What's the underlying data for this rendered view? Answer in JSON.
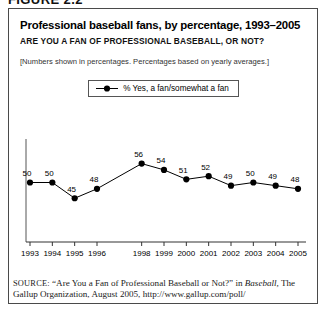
{
  "figure": {
    "label": "FIGURE 2.2"
  },
  "header": {
    "title": "Professional baseball fans, by percentage, 1993–2005",
    "subtitle": "ARE YOU A FAN OF PROFESSIONAL BASEBALL, OR NOT?",
    "note": "[Numbers shown in percentages. Percentages based on yearly averages.]"
  },
  "legend": {
    "items": [
      {
        "label": "% Yes, a fan/somewhat a fan",
        "color": "#000000",
        "marker": "circle"
      }
    ]
  },
  "source": {
    "kicker": "SOURCE:",
    "part1": " “Are You a Fan of Professional Baseball or Not?” in ",
    "italic1": "Baseball,",
    "part2": "The Gallup Organization, August 2005, http://www.gallup.com/poll/"
  },
  "chart_data": {
    "type": "line",
    "title": "Professional baseball fans, by percentage, 1993–2005",
    "subtitle": "ARE YOU A FAN OF PROFESSIONAL BASEBALL, OR NOT?",
    "xlabel": "",
    "ylabel": "",
    "grid": false,
    "legend_position": "top-center",
    "categories": [
      "1993",
      "1994",
      "1995",
      "1996",
      "1998",
      "1999",
      "2000",
      "2001",
      "2002",
      "2003",
      "2004",
      "2005"
    ],
    "series": [
      {
        "name": "% Yes, a fan/somewhat a fan",
        "color": "#000000",
        "values": [
          50,
          50,
          45,
          48,
          56,
          54,
          51,
          52,
          49,
          50,
          49,
          48
        ]
      }
    ],
    "point_labels": [
      "50",
      "50",
      "45",
      "48",
      "56",
      "54",
      "51",
      "52",
      "49",
      "50",
      "49",
      "48"
    ],
    "ylim": [
      40,
      60
    ],
    "note": "Year 1997 is absent from the axis; no tick or data point is plotted for it."
  }
}
